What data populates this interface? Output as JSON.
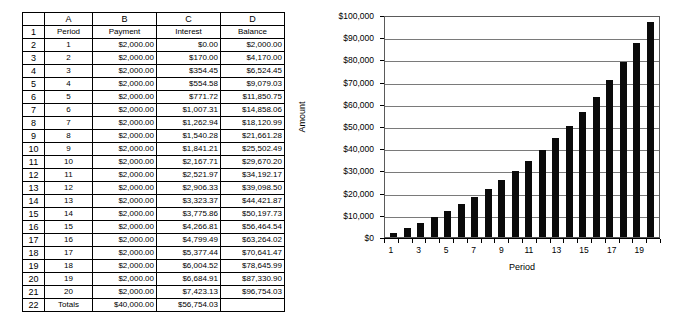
{
  "spreadsheet": {
    "column_headers": [
      "",
      "A",
      "B",
      "C",
      "D"
    ],
    "field_headers": [
      "Period",
      "Payment",
      "Interest",
      "Balance"
    ],
    "row_numbers": [
      "1",
      "2",
      "3",
      "4",
      "5",
      "6",
      "7",
      "8",
      "9",
      "10",
      "11",
      "12",
      "13",
      "14",
      "15",
      "16",
      "17",
      "18",
      "19",
      "20",
      "21",
      "22"
    ],
    "rows": [
      {
        "row": "2",
        "period": "1",
        "payment": "$2,000.00",
        "interest": "$0.00",
        "balance": "$2,000.00"
      },
      {
        "row": "3",
        "period": "2",
        "payment": "$2,000.00",
        "interest": "$170.00",
        "balance": "$4,170.00"
      },
      {
        "row": "4",
        "period": "3",
        "payment": "$2,000.00",
        "interest": "$354.45",
        "balance": "$6,524.45"
      },
      {
        "row": "5",
        "period": "4",
        "payment": "$2,000.00",
        "interest": "$554.58",
        "balance": "$9,079.03"
      },
      {
        "row": "6",
        "period": "5",
        "payment": "$2,000.00",
        "interest": "$771.72",
        "balance": "$11,850.75"
      },
      {
        "row": "7",
        "period": "6",
        "payment": "$2,000.00",
        "interest": "$1,007.31",
        "balance": "$14,858.06"
      },
      {
        "row": "8",
        "period": "7",
        "payment": "$2,000.00",
        "interest": "$1,262.94",
        "balance": "$18,120.99"
      },
      {
        "row": "9",
        "period": "8",
        "payment": "$2,000.00",
        "interest": "$1,540.28",
        "balance": "$21,661.28"
      },
      {
        "row": "10",
        "period": "9",
        "payment": "$2,000.00",
        "interest": "$1,841.21",
        "balance": "$25,502.49"
      },
      {
        "row": "11",
        "period": "10",
        "payment": "$2,000.00",
        "interest": "$2,167.71",
        "balance": "$29,670.20"
      },
      {
        "row": "12",
        "period": "11",
        "payment": "$2,000.00",
        "interest": "$2,521.97",
        "balance": "$34,192.17"
      },
      {
        "row": "13",
        "period": "12",
        "payment": "$2,000.00",
        "interest": "$2,906.33",
        "balance": "$39,098.50"
      },
      {
        "row": "14",
        "period": "13",
        "payment": "$2,000.00",
        "interest": "$3,323.37",
        "balance": "$44,421.87"
      },
      {
        "row": "15",
        "period": "14",
        "payment": "$2,000.00",
        "interest": "$3,775.86",
        "balance": "$50,197.73"
      },
      {
        "row": "16",
        "period": "15",
        "payment": "$2,000.00",
        "interest": "$4,266.81",
        "balance": "$56,464.54"
      },
      {
        "row": "17",
        "period": "16",
        "payment": "$2,000.00",
        "interest": "$4,799.49",
        "balance": "$63,264.02"
      },
      {
        "row": "18",
        "period": "17",
        "payment": "$2,000.00",
        "interest": "$5,377.44",
        "balance": "$70,641.47"
      },
      {
        "row": "19",
        "period": "18",
        "payment": "$2,000.00",
        "interest": "$6,004.52",
        "balance": "$78,645.99"
      },
      {
        "row": "20",
        "period": "19",
        "payment": "$2,000.00",
        "interest": "$6,684.91",
        "balance": "$87,330.90"
      },
      {
        "row": "21",
        "period": "20",
        "payment": "$2,000.00",
        "interest": "$7,423.13",
        "balance": "$96,754.03"
      },
      {
        "row": "22",
        "period": "Totals",
        "payment": "$40,000.00",
        "interest": "$56,754.03",
        "balance": ""
      }
    ]
  },
  "chart_data": {
    "type": "bar",
    "title": "",
    "xlabel": "Period",
    "ylabel": "Amount",
    "categories": [
      "1",
      "2",
      "3",
      "4",
      "5",
      "6",
      "7",
      "8",
      "9",
      "10",
      "11",
      "12",
      "13",
      "14",
      "15",
      "16",
      "17",
      "18",
      "19",
      "20"
    ],
    "values": [
      2000.0,
      4170.0,
      6524.45,
      9079.03,
      11850.75,
      14858.06,
      18120.99,
      21661.28,
      25502.49,
      29670.2,
      34192.17,
      39098.5,
      44421.87,
      50197.73,
      56464.54,
      63264.02,
      70641.47,
      78645.99,
      87330.9,
      96754.03
    ],
    "ylim": [
      0,
      100000
    ],
    "ytick_values": [
      0,
      10000,
      20000,
      30000,
      40000,
      50000,
      60000,
      70000,
      80000,
      90000,
      100000
    ],
    "ytick_labels": [
      "$0",
      "$10,000",
      "$20,000",
      "$30,000",
      "$40,000",
      "$50,000",
      "$60,000",
      "$70,000",
      "$80,000",
      "$90,000",
      "$100,000"
    ],
    "xtick_labels": [
      "1",
      "3",
      "5",
      "7",
      "9",
      "11",
      "13",
      "15",
      "17",
      "19"
    ],
    "grid": true,
    "legend": false,
    "bar_color": "#0a0a0a"
  },
  "colors": {
    "bar": "#0a0a0a",
    "grid": "#7a7a7a",
    "border": "#000000"
  }
}
